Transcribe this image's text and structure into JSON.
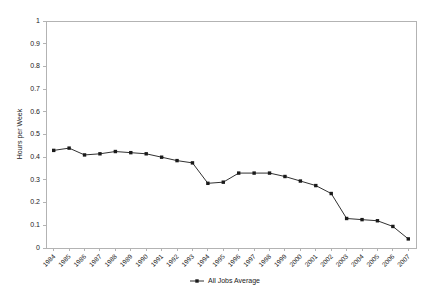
{
  "chart_data": {
    "type": "line",
    "title": "",
    "subtitle": "",
    "xlabel": "",
    "ylabel": "Hours per Week",
    "ylim": [
      0,
      1
    ],
    "ytick_step": 0.1,
    "grid": false,
    "legend_position": "bottom-center",
    "marker": "square",
    "line_color": "#1a1a1a",
    "axis_color": "#b3b3b3",
    "categories": [
      "1984",
      "1985",
      "1986",
      "1987",
      "1988",
      "1989",
      "1990",
      "1991",
      "1992",
      "1993",
      "1994",
      "1995",
      "1996",
      "1997",
      "1998",
      "1999",
      "2000",
      "2001",
      "2002",
      "2003",
      "2004",
      "2005",
      "2006",
      "2007"
    ],
    "yticks": [
      "0",
      "0.1",
      "0.2",
      "0.3",
      "0.4",
      "0.5",
      "0.6",
      "0.7",
      "0.8",
      "0.9",
      "1"
    ],
    "series": [
      {
        "name": "All Jobs Average",
        "values": [
          0.43,
          0.44,
          0.41,
          0.415,
          0.425,
          0.42,
          0.415,
          0.4,
          0.385,
          0.375,
          0.285,
          0.29,
          0.33,
          0.33,
          0.33,
          0.315,
          0.295,
          0.275,
          0.24,
          0.13,
          0.125,
          0.12,
          0.095,
          0.04
        ]
      }
    ]
  },
  "legend": {
    "entries": [
      {
        "label": "All Jobs Average"
      }
    ]
  }
}
